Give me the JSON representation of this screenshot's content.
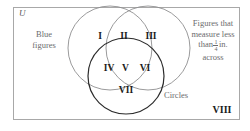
{
  "diagram": {
    "universe_label": "U",
    "set_labels": {
      "left": "Blue figures",
      "left_line1": "Blue",
      "left_line2": "figures",
      "right_line1": "Figures that",
      "right_line2": "measure less",
      "right_line3_prefix": "than",
      "right_fraction_numerator": "1",
      "right_fraction_denominator": "4",
      "right_line3_suffix": "in.",
      "right_line4": "across",
      "bottom": "Circles"
    },
    "regions": [
      {
        "id": "I",
        "label": "I",
        "description": "blue figures only"
      },
      {
        "id": "II",
        "label": "II",
        "description": "blue and small"
      },
      {
        "id": "III",
        "label": "III",
        "description": "small figures only"
      },
      {
        "id": "IV",
        "label": "IV",
        "description": "blue and circles"
      },
      {
        "id": "V",
        "label": "V",
        "description": "blue, small and circles"
      },
      {
        "id": "VI",
        "label": "VI",
        "description": "small and circles"
      },
      {
        "id": "VII",
        "label": "VII",
        "description": "circles only"
      },
      {
        "id": "VIII",
        "label": "VIII",
        "description": "outside all sets"
      }
    ],
    "circles": [
      {
        "name": "blue-figures-circle",
        "cx": 110,
        "cy": 48,
        "r": 42,
        "stroke": "#8e8e90",
        "stroke_width": 0.9
      },
      {
        "name": "small-figures-circle",
        "cx": 148,
        "cy": 48,
        "r": 42,
        "stroke": "#8e8e90",
        "stroke_width": 0.9
      },
      {
        "name": "circles-circle",
        "cx": 126,
        "cy": 76,
        "r": 38,
        "stroke": "#2b2b2b",
        "stroke_width": 1.2
      }
    ],
    "colors": {
      "border": "#a8a8a8",
      "label_text": "#6b6b6d",
      "region_text": "#1a1a1a",
      "circle_light": "#8e8e90",
      "circle_dark": "#2b2b2b",
      "background": "#ffffff"
    }
  }
}
